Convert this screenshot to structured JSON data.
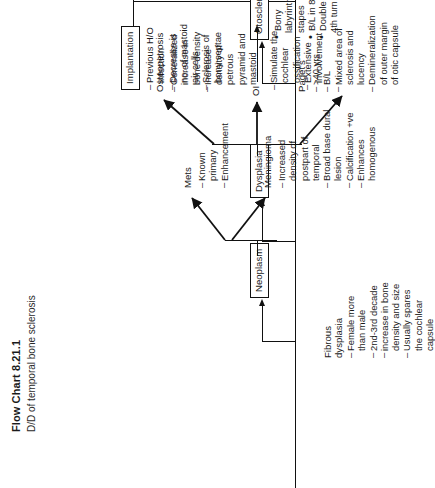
{
  "document": {
    "title": "Flow Chart 8.21.1",
    "subtitle": "D/D of temporal bone sclerosis"
  },
  "nodes": {
    "neoplasm": "Neoplasm",
    "dysplasia": "Dysplasia",
    "otosclerosis": "Otosclerosis",
    "implantation": "Implantation"
  },
  "branches": {
    "mets": {
      "label": "Mets",
      "items": [
        {
          "dash": "–",
          "text": "Known"
        },
        {
          "dash": "",
          "text": "primary"
        },
        {
          "dash": "–",
          "text": "Enhancement"
        }
      ]
    },
    "meningioma": {
      "label": "Meningioma",
      "items": [
        {
          "dash": "–",
          "text": "Increased"
        },
        {
          "dash": "",
          "text": "density of"
        },
        {
          "dash": "",
          "text": "postpart of"
        },
        {
          "dash": "",
          "text": "temporal"
        },
        {
          "dash": "–",
          "text": "Broad base dural"
        },
        {
          "dash": "",
          "text": "lesion"
        },
        {
          "dash": "–",
          "text": "Calcification +ve"
        },
        {
          "dash": "–",
          "text": "Enhances"
        },
        {
          "dash": "",
          "text": "homogenous"
        }
      ]
    },
    "osteopetrosis": {
      "label": "Osteopetrosis",
      "items": [
        {
          "dash": "–",
          "text": "Generalized"
        },
        {
          "dash": "",
          "text": "increase in"
        },
        {
          "dash": "",
          "text": "bone density"
        },
        {
          "dash": "–",
          "text": "Increase"
        },
        {
          "dash": "",
          "text": "density of"
        },
        {
          "dash": "",
          "text": "petrous"
        },
        {
          "dash": "",
          "text": "pyramid and"
        },
        {
          "dash": "",
          "text": "mastoid"
        }
      ]
    },
    "oi": {
      "label": "OI",
      "items": [
        {
          "dash": "–",
          "text": "Simulate the"
        },
        {
          "dash": "",
          "text": "cochlear"
        },
        {
          "dash": "",
          "text": "ossification"
        },
        {
          "dash": "–",
          "text": "Extensive"
        },
        {
          "dash": "",
          "text": "involvement"
        }
      ]
    },
    "pagets": {
      "label": "Paget's",
      "items": [
        {
          "dash": "–",
          "text": ">40 yrs"
        },
        {
          "dash": "–",
          "text": "B/L"
        },
        {
          "dash": "–",
          "text": "Mixed area of"
        },
        {
          "dash": "",
          "text": "sclerosis and"
        },
        {
          "dash": "",
          "text": "lucency"
        },
        {
          "dash": "–",
          "text": "Demineralization"
        },
        {
          "dash": "",
          "text": "of outer margin"
        },
        {
          "dash": "",
          "text": "of otic capsule"
        }
      ]
    },
    "fibrous_dysplasia": {
      "label_line1": "Fibrous",
      "label_line2": "dysplasia",
      "items": [
        {
          "dash": "–",
          "text": "Female more"
        },
        {
          "dash": "",
          "text": "than male"
        },
        {
          "dash": "–",
          "text": "2nd-3rd decade"
        },
        {
          "dash": "–",
          "text": "increase in bone"
        },
        {
          "dash": "",
          "text": "density and size"
        },
        {
          "dash": "–",
          "text": "Usually spares"
        },
        {
          "dash": "",
          "text": "the cochlear"
        },
        {
          "dash": "",
          "text": "capsule"
        }
      ]
    },
    "otosclerosis_details": {
      "items": [
        {
          "dash": "•",
          "text": "Bony"
        },
        {
          "dash": "",
          "text": "labyrinth and"
        },
        {
          "dash": "",
          "text": "stapes"
        },
        {
          "dash": "•",
          "text": "B/L in 80%"
        },
        {
          "dash": "•",
          "text": "Double ring or"
        },
        {
          "dash": "",
          "text": "4th turn sign"
        }
      ]
    },
    "implantation_details": {
      "items": [
        {
          "dash": "–",
          "text": "Previous H/O"
        },
        {
          "dash": "",
          "text": "infection"
        },
        {
          "dash": "–",
          "text": "Decrease is"
        },
        {
          "dash": "",
          "text": "no. of mastoid"
        },
        {
          "dash": "",
          "text": "air cells"
        },
        {
          "dash": "–",
          "text": "Sclerosis of"
        },
        {
          "dash": "",
          "text": "bony septae"
        }
      ]
    }
  },
  "colors": {
    "ink": "#111111",
    "background": "#ffffff"
  }
}
